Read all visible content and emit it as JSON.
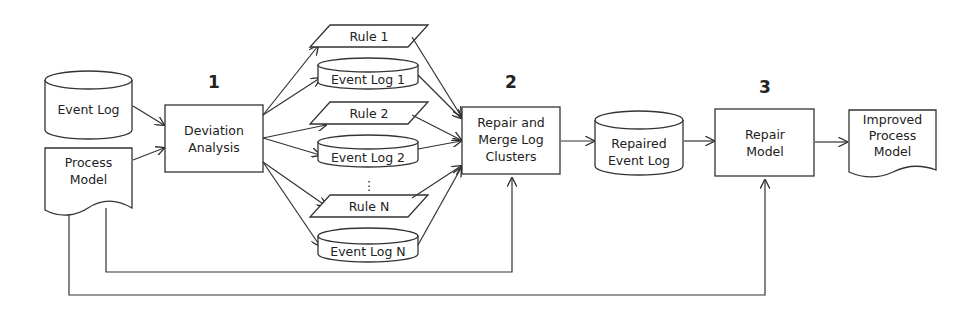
{
  "diagram": {
    "step_numbers": {
      "step1": "1",
      "step2": "2",
      "step3": "3"
    },
    "inputs": {
      "event_log": "Event Log",
      "process_model": [
        "Process",
        "Model"
      ]
    },
    "deviation_analysis": [
      "Deviation",
      "Analysis"
    ],
    "clusters": [
      {
        "rule": "Rule 1",
        "log": "Event Log 1"
      },
      {
        "rule": "Rule 2",
        "log": "Event Log 2"
      },
      {
        "rule": "Rule N",
        "log": "Event Log N"
      }
    ],
    "ellipsis": "⋮",
    "repair_merge": [
      "Repair and",
      "Merge Log",
      "Clusters"
    ],
    "repaired_event_log": [
      "Repaired",
      "Event Log"
    ],
    "repair_model": [
      "Repair",
      "Model"
    ],
    "improved_process_model": [
      "Improved",
      "Process",
      "Model"
    ],
    "colors": {
      "stroke": "#333333",
      "background": "#ffffff",
      "text": "#222222"
    }
  }
}
